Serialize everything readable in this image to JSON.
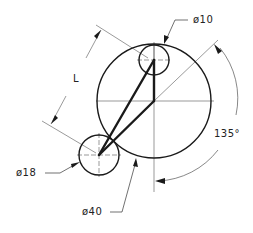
{
  "drawing": {
    "type": "technical-drawing",
    "colors": {
      "line": "#1a1a1a",
      "thin": "#555555",
      "background": "#ffffff"
    },
    "circles": [
      {
        "name": "large-circle",
        "diameter_label": "ø40",
        "cx": 154,
        "cy": 101,
        "r": 57
      },
      {
        "name": "top-small-circle",
        "diameter_label": "ø10",
        "cx": 154,
        "cy": 60,
        "r": 15
      },
      {
        "name": "left-circle",
        "diameter_label": "ø18",
        "cx": 99,
        "cy": 155,
        "r": 20
      }
    ],
    "dimensions": {
      "length_label": "L",
      "angle_label": "135°"
    }
  },
  "labels": {
    "d10": "ø10",
    "d18": "ø18",
    "d40": "ø40",
    "length": "L",
    "angle": "135°"
  }
}
